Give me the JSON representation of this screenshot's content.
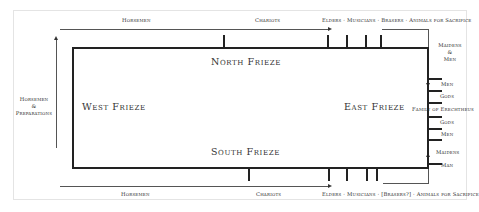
{
  "diagram": {
    "friezes": {
      "north": "North Frieze",
      "south": "South Frieze",
      "east": "East Frieze",
      "west": "West Frieze"
    },
    "north_side_labels": {
      "horsemen": "Horsemen",
      "chariots": "Chariots",
      "procession": "Elders · Musicians · Brasers · Animals for Sacrifice"
    },
    "south_side_labels": {
      "horsemen": "Horsemen",
      "chariots": "Chariots",
      "procession": "Elders · Musicians · [Brasers?] · Animals for Sacrifice"
    },
    "west_side_label": {
      "line1": "Horsemen",
      "line2": "&",
      "line3": "Preparations"
    },
    "east_side_labels": {
      "top_group": {
        "line1": "Maidens",
        "line2": "&",
        "line3": "Men"
      },
      "items": [
        "Men",
        "Gods",
        "Family of Erechtheus",
        "Gods",
        "Men"
      ],
      "bottom_group": {
        "line1": "Maidens",
        "line2": "Man"
      }
    }
  }
}
